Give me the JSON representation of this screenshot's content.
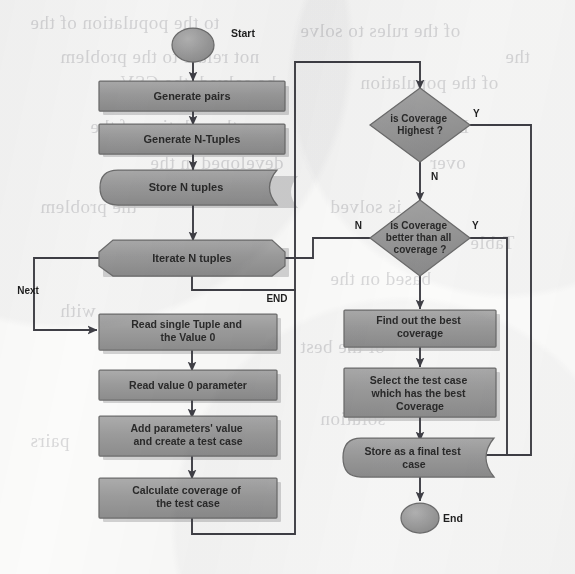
{
  "document": {
    "kind": "flowchart",
    "title": "Test case generation flowchart",
    "background_color": "#fbfbfa",
    "node_fill": "#9b9b9b",
    "node_stroke": "#6d6d6d",
    "node_text_color": "#2b2b2b",
    "connector_color": "#4a4a50",
    "shadow_color": "#c9c9c9"
  },
  "nodes": {
    "start": {
      "id": "start",
      "label": "Start",
      "shape": "terminator",
      "label_position": "right"
    },
    "generate_pairs": {
      "id": "generate_pairs",
      "label": "Generate pairs",
      "shape": "process"
    },
    "generate_tuples": {
      "id": "generate_tuples",
      "label": "Generate N-Tuples",
      "shape": "process"
    },
    "store_tuples": {
      "id": "store_tuples",
      "label": "Store N tuples",
      "shape": "data-storage"
    },
    "iterate_tuples": {
      "id": "iterate_tuples",
      "label": "Iterate N tuples",
      "shape": "preparation"
    },
    "read_tuple": {
      "id": "read_tuple",
      "label": "Read single Tuple and the Value 0",
      "shape": "process"
    },
    "read_value": {
      "id": "read_value",
      "label": "Read value 0 parameter",
      "shape": "process"
    },
    "add_params": {
      "id": "add_params",
      "label": "Add parameters' value and create a test case",
      "shape": "process"
    },
    "calc_coverage": {
      "id": "calc_coverage",
      "label": "Calculate coverage of the test case",
      "shape": "process"
    },
    "is_highest": {
      "id": "is_highest",
      "label": "is Coverage Highest ?",
      "shape": "decision"
    },
    "is_better": {
      "id": "is_better",
      "label": "is Coverage better than all coverage ?",
      "shape": "decision"
    },
    "find_best": {
      "id": "find_best",
      "label": "Find out the best coverage",
      "shape": "process"
    },
    "select_case": {
      "id": "select_case",
      "label": "Select the test case which has the best Coverage",
      "shape": "process"
    },
    "store_final": {
      "id": "store_final",
      "label": "Store as a final test case",
      "shape": "data-storage"
    },
    "end": {
      "id": "end",
      "label": "End",
      "shape": "terminator",
      "label_position": "right"
    }
  },
  "edge_labels": {
    "next": "Next",
    "end": "END",
    "highest_yes": "Y",
    "highest_no": "N",
    "better_yes": "Y",
    "better_no": "N"
  },
  "bleed_through_text": [
    {
      "text": "to the population of the",
      "x": 30,
      "y": 12
    },
    {
      "text": "of the rules to solve",
      "x": 300,
      "y": 20
    },
    {
      "text": "not relate to the problem",
      "x": 60,
      "y": 46
    },
    {
      "text": "the",
      "x": 505,
      "y": 46
    },
    {
      "text": "be solved, the CSV",
      "x": 120,
      "y": 72
    },
    {
      "text": "of the population",
      "x": 360,
      "y": 72
    },
    {
      "text": "the solution of the",
      "x": 90,
      "y": 116
    },
    {
      "text": "Based",
      "x": 420,
      "y": 116
    },
    {
      "text": "developed in the",
      "x": 150,
      "y": 152
    },
    {
      "text": "over",
      "x": 430,
      "y": 152
    },
    {
      "text": "the problem",
      "x": 40,
      "y": 196
    },
    {
      "text": "is solved",
      "x": 330,
      "y": 196
    },
    {
      "text": "Table",
      "x": 470,
      "y": 232
    },
    {
      "text": "based on the",
      "x": 330,
      "y": 268
    },
    {
      "text": "with",
      "x": 60,
      "y": 300
    },
    {
      "text": "of the best",
      "x": 300,
      "y": 336
    },
    {
      "text": "the",
      "x": 460,
      "y": 372
    },
    {
      "text": "solution",
      "x": 320,
      "y": 408
    },
    {
      "text": "pairs",
      "x": 30,
      "y": 430
    }
  ]
}
